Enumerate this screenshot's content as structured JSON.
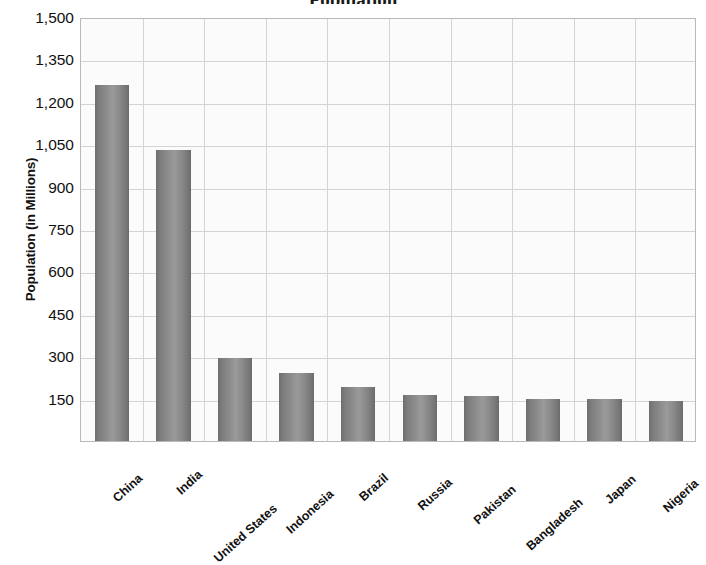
{
  "chart_data": {
    "type": "bar",
    "title": "Population",
    "xlabel": "",
    "ylabel": "Population (in Millions)",
    "categories": [
      "China",
      "India",
      "United States",
      "Indonesia",
      "Brazil",
      "Russia",
      "Pakistan",
      "Bangladesh",
      "Japan",
      "Nigeria"
    ],
    "values": [
      1261,
      1030,
      295,
      240,
      190,
      162,
      158,
      148,
      148,
      143
    ],
    "ylim": [
      0,
      1500
    ],
    "yticks": [
      150,
      300,
      450,
      600,
      750,
      900,
      1050,
      1200,
      1350,
      1500
    ],
    "ytick_labels": [
      "150",
      "300",
      "450",
      "600",
      "750",
      "900",
      "1,050",
      "1,200",
      "1,350",
      "1,500"
    ],
    "grid": true,
    "legend": "none",
    "bar_color": "#8a8a8a",
    "plot_background": "#fbfbfb",
    "grid_color": "#d4d4d4",
    "axis_color": "#b9b9b9",
    "text_color": "#111111"
  },
  "axes": {
    "y_title": "Population (in Millions)"
  }
}
